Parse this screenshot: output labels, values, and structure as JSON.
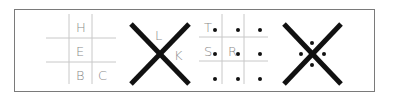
{
  "colors": {
    "frame": "#7a7a7a",
    "grid": "#c8c8c8",
    "x_stroke": "#111111",
    "dot": "#111111",
    "label": "#8a8a8a"
  },
  "panels": [
    {
      "type": "grid",
      "dotted": false,
      "labels": {
        "top_middle": "H",
        "center": "E",
        "bottom_middle": "B",
        "bottom_right": "C"
      }
    },
    {
      "type": "x",
      "dotted": false,
      "labels": {
        "top": "L",
        "right": "K"
      }
    },
    {
      "type": "grid",
      "dotted": true,
      "labels": {
        "top_left": "T",
        "middle_left": "S",
        "center": "R"
      }
    },
    {
      "type": "x",
      "dotted": true,
      "labels": {}
    }
  ]
}
